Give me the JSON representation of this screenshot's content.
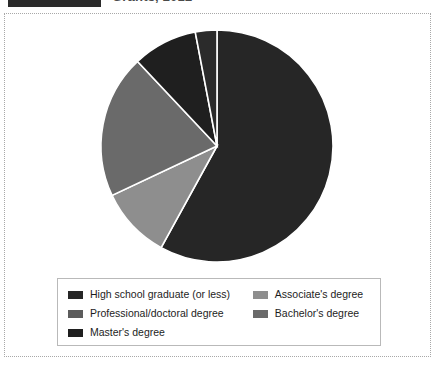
{
  "header": {
    "bar_label": "",
    "title": "Grants, 2012"
  },
  "chart_data": {
    "type": "pie",
    "title": "",
    "subtitle": "",
    "xlabel": "",
    "ylabel": "",
    "legend_position": "bottom",
    "grid": false,
    "start_angle_deg": 0,
    "direction": "clockwise",
    "units": "percent",
    "categories": [
      "High school graduate (or less)",
      "Associate's degree",
      "Bachelor's degree",
      "Professional/doctoral degree",
      "Master's degree"
    ],
    "values": [
      58,
      10,
      20,
      9,
      3
    ],
    "colors": [
      "#262626",
      "#8e8e8e",
      "#6a6a6a",
      "#1f1f1f",
      "#2b2b2b"
    ],
    "slices": [
      {
        "label": "High school graduate (or less)",
        "value": 58,
        "color": "#262626"
      },
      {
        "label": "Associate's degree",
        "value": 10,
        "color": "#8e8e8e"
      },
      {
        "label": "Bachelor's degree",
        "value": 20,
        "color": "#6a6a6a"
      },
      {
        "label": "Professional/doctoral degree",
        "value": 9,
        "color": "#1f1f1f"
      },
      {
        "label": "Master's degree",
        "value": 3,
        "color": "#2b2b2b"
      }
    ]
  },
  "legend": {
    "rows": [
      {
        "left": {
          "label": "High school graduate (or less)",
          "color": "#262626"
        },
        "right": {
          "label": "Associate's degree",
          "color": "#8e8e8e"
        }
      },
      {
        "left": {
          "label": "Professional/doctoral degree",
          "color": "#5c5c5c"
        },
        "right": {
          "label": "Bachelor's degree",
          "color": "#6a6a6a"
        }
      },
      {
        "left": {
          "label": "Master's degree",
          "color": "#1f1f1f"
        },
        "right": {
          "label": "",
          "color": ""
        }
      }
    ]
  },
  "style": {
    "frame_border_color": "#a8a8a8",
    "legend_border_color": "#b9b9b9",
    "slice_separator_color": "#ffffff",
    "background": "#ffffff"
  }
}
